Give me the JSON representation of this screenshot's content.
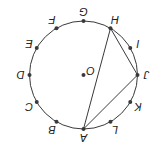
{
  "diagram": {
    "type": "geometry-circle",
    "orientation": "rotated-180",
    "background": "#ffffff",
    "stroke_color": "#3a3a3a",
    "circle": {
      "center_label": "O",
      "center_drawing": [
        76.5,
        74
      ],
      "radius": 54
    },
    "points": [
      {
        "label": "A",
        "angle_deg": -90
      },
      {
        "label": "B",
        "angle_deg": -60
      },
      {
        "label": "C",
        "angle_deg": -30
      },
      {
        "label": "D",
        "angle_deg": 0
      },
      {
        "label": "E",
        "angle_deg": 30
      },
      {
        "label": "F",
        "angle_deg": 60
      },
      {
        "label": "G",
        "angle_deg": 90
      },
      {
        "label": "H",
        "angle_deg": 120
      },
      {
        "label": "I",
        "angle_deg": 150
      },
      {
        "label": "J",
        "angle_deg": 180
      },
      {
        "label": "K",
        "angle_deg": 210
      },
      {
        "label": "L",
        "angle_deg": 240
      }
    ],
    "segments": [
      [
        "A",
        "H"
      ],
      [
        "H",
        "J"
      ],
      [
        "J",
        "A"
      ]
    ]
  }
}
